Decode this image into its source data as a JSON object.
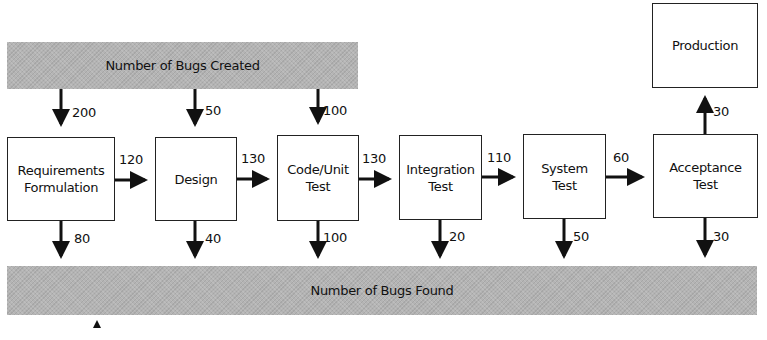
{
  "bands": {
    "created": "Number of Bugs Created",
    "found": "Number of Bugs Found"
  },
  "stages": [
    {
      "id": "requirements",
      "label": "Requirements Formulation",
      "line1": "Requirements",
      "line2": "Formulation",
      "bugs_created": "200",
      "bugs_found": "80",
      "passed_on": "120"
    },
    {
      "id": "design",
      "label": "Design",
      "line1": "Design",
      "line2": "",
      "bugs_created": "50",
      "bugs_found": "40",
      "passed_on": "130"
    },
    {
      "id": "code-unit-test",
      "label": "Code/Unit Test",
      "line1": "Code/Unit",
      "line2": "Test",
      "bugs_created": "100",
      "bugs_found": "100",
      "passed_on": "130"
    },
    {
      "id": "integration-test",
      "label": "Integration Test",
      "line1": "Integration",
      "line2": "Test",
      "bugs_found": "20",
      "passed_on": "110"
    },
    {
      "id": "system-test",
      "label": "System Test",
      "line1": "System",
      "line2": "Test",
      "bugs_found": "50",
      "passed_on": "60"
    },
    {
      "id": "acceptance-test",
      "label": "Acceptance Test",
      "line1": "Acceptance",
      "line2": "Test",
      "bugs_found": "30",
      "passed_on": "30"
    }
  ],
  "production": {
    "label": "Production"
  }
}
